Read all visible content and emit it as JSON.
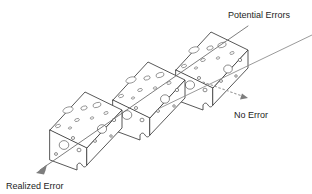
{
  "diagram": {
    "background_color": "#ffffff",
    "line_color": "#3a3a3a",
    "trajectory_color": "#8e8e8e",
    "text_color": "#1d1d1d",
    "labels": {
      "potential_errors": "Potential Errors",
      "no_error": "No Error",
      "realized_error": "Realized Error"
    },
    "layers": [
      {
        "name": "front-slab",
        "order": 1
      },
      {
        "name": "middle-slab",
        "order": 2
      },
      {
        "name": "back-slab",
        "order": 3
      }
    ],
    "trajectories": [
      {
        "name": "realized-error-path",
        "style": "solid",
        "outcome": "Realized Error"
      },
      {
        "name": "blocked-path",
        "style": "solid",
        "outcome": "Potential Errors"
      },
      {
        "name": "no-error-path",
        "style": "dotted",
        "outcome": "No Error"
      }
    ]
  }
}
